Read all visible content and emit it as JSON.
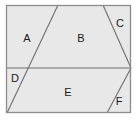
{
  "figure": {
    "name": "partitioned-rectangle",
    "canvas": {
      "width": 137,
      "height": 120
    },
    "colors": {
      "page_background": "#ffffff",
      "region_fill": "#e8e8e8",
      "outer_border": "#8c8c8c",
      "divider_line": "#6e6e6e",
      "label_text": "#1a1a1a"
    },
    "outer_rect": {
      "x": 6,
      "y": 5,
      "width": 125,
      "height": 108
    },
    "lines": [
      {
        "name": "horizontal-divider",
        "x1": 6,
        "y1": 68,
        "x2": 131,
        "y2": 68
      },
      {
        "name": "line-a-b",
        "x1": 58,
        "y1": 5,
        "x2": 7,
        "y2": 113
      },
      {
        "name": "line-b-c",
        "x1": 103,
        "y1": 5,
        "x2": 131,
        "y2": 68
      },
      {
        "name": "line-e-f",
        "x1": 131,
        "y1": 68,
        "x2": 107,
        "y2": 113
      }
    ],
    "regions": [
      {
        "id": "A",
        "label": "A",
        "label_x": 27,
        "label_y": 38
      },
      {
        "id": "B",
        "label": "B",
        "label_x": 81,
        "label_y": 38
      },
      {
        "id": "C",
        "label": "C",
        "label_x": 120,
        "label_y": 23
      },
      {
        "id": "D",
        "label": "D",
        "label_x": 15,
        "label_y": 78
      },
      {
        "id": "E",
        "label": "E",
        "label_x": 68,
        "label_y": 92
      },
      {
        "id": "F",
        "label": "F",
        "label_x": 119,
        "label_y": 101
      }
    ]
  }
}
